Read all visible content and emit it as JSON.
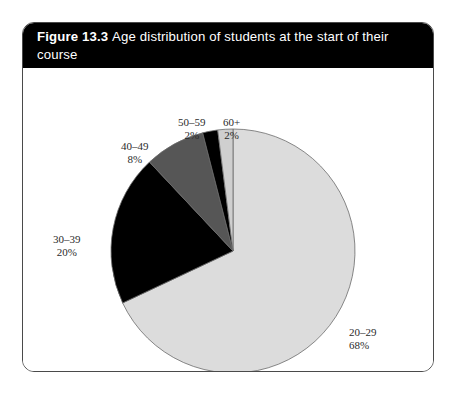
{
  "figure": {
    "number": "Figure 13.3",
    "caption": "Age distribution of students at the start of their course"
  },
  "colors": {
    "slice_20_29": "#dcdcdc",
    "slice_30_39": "#000000",
    "slice_40_49": "#565656",
    "slice_50_59": "#000000",
    "slice_60_plus": "#cfcfcf",
    "outline": "#6b6b6b",
    "header_background": "#000000",
    "header_text": "#ffffff",
    "label_text": "#2b2b2b",
    "card_border": "#4a4a4a"
  },
  "chart_data": {
    "type": "pie",
    "title": "Age distribution of students at the start of their course",
    "xlabel": "",
    "ylabel": "",
    "unit": "%",
    "start_angle_deg": 0,
    "direction": "clockwise",
    "legend": "none",
    "grid": false,
    "categories": [
      "20–29",
      "30–39",
      "40–49",
      "50–59",
      "60+"
    ],
    "values": [
      68,
      20,
      8,
      2,
      2
    ],
    "slices": [
      {
        "label": "20–29",
        "value": 68,
        "value_text": "68%",
        "color": "#dcdcdc"
      },
      {
        "label": "30–39",
        "value": 20,
        "value_text": "20%",
        "color": "#000000"
      },
      {
        "label": "40–49",
        "value": 8,
        "value_text": "8%",
        "color": "#565656"
      },
      {
        "label": "50–59",
        "value": 2,
        "value_text": "2%",
        "color": "#000000"
      },
      {
        "label": "60+",
        "value": 2,
        "value_text": "2%",
        "color": "#cfcfcf"
      }
    ],
    "total": 100
  },
  "labels": {
    "l20_29": {
      "cat": "20–29",
      "pct": "68%"
    },
    "l30_39": {
      "cat": "30–39",
      "pct": "20%"
    },
    "l40_49": {
      "cat": "40–49",
      "pct": "8%"
    },
    "l50_59": {
      "cat": "50–59",
      "pct": "2%"
    },
    "l60plus": {
      "cat": "60+",
      "pct": "2%"
    }
  }
}
